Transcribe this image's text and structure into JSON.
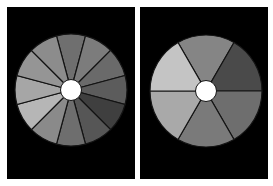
{
  "figure": {
    "background": "#ffffff",
    "panels": [
      {
        "id": "left",
        "background": "#000000",
        "wheel": {
          "segments": 12,
          "start_angle_deg": -105,
          "divider_color": "#141414",
          "hub_color": "#ffffff",
          "segment_colors": [
            "#6f6f6f",
            "#7c7c7c",
            "#6a6a6a",
            "#5c5c5c",
            "#3f3f3f",
            "#565656",
            "#6e6e6e",
            "#8a8a8a",
            "#b6b6b6",
            "#a6a6a6",
            "#959595",
            "#8c8c8c"
          ]
        }
      },
      {
        "id": "right",
        "background": "#000000",
        "wheel": {
          "segments": 6,
          "start_angle_deg": -120,
          "divider_color": "#141414",
          "hub_color": "#ffffff",
          "segment_colors": [
            "#858585",
            "#4a4a4a",
            "#6e6e6e",
            "#7a7a7a",
            "#a9a9a9",
            "#c4c4c4"
          ]
        }
      }
    ]
  }
}
